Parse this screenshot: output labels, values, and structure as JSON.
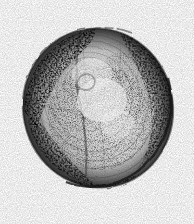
{
  "image": {
    "kind": "scanned-scientific-illustration",
    "medium": "pen-and-ink stipple drawing",
    "subject": "bivalve shell valve",
    "alt_text": "Scanned pen-and-ink stipple illustration of a rounded bivalve shell valve shown in outer face view, with concentric growth lines and graded stippled shading, on a white page with a dark vertical scan edge at the left.",
    "width_px": 194,
    "height_px": 224,
    "background_color": "#ffffff",
    "ink_color": "#2b2b2b",
    "midtone_color": "#8a8a8a",
    "light_tone_color": "#cfcfcf",
    "has_text": false,
    "has_caption": false,
    "has_scale_bar": false
  },
  "artifacts": {
    "scan_edge": {
      "name": "page-edge-line",
      "position": "left",
      "x_px": 3,
      "width_px": 2,
      "color": "#2f2f2f",
      "spans_full_height": true
    }
  },
  "subject": {
    "outline": {
      "shape": "ovate-subcircular",
      "center_x_px": 98,
      "center_y_px": 108,
      "width_px": 150,
      "height_px": 160,
      "rotation_deg": -12,
      "bounds": {
        "left_px": 23,
        "top_px": 28,
        "right_px": 173,
        "bottom_px": 188
      },
      "outline_color": "#262626",
      "outline_weight": "heavy on right and lower margins, lighter on upper left"
    },
    "features": [
      {
        "name": "umbo-beak",
        "location": "upper left of centre",
        "x_px": 78,
        "y_px": 46
      },
      {
        "name": "radial-hinge-line",
        "description": "dark radial band running from the umbo down through the centre-left"
      },
      {
        "name": "concentric-growth-lines",
        "description": "nested arcs following the valve margin, densest on the lower left quadrant"
      },
      {
        "name": "central-highlight",
        "description": "pale unstippled area just below and right of centre",
        "x_px": 100,
        "y_px": 100
      },
      {
        "name": "marginal-shadow",
        "description": "dense stippling along the upper-left and right rims"
      }
    ],
    "shading": {
      "darkest_regions": [
        "upper-left rim",
        "right rim",
        "lower margin"
      ],
      "lightest_regions": [
        "centre",
        "upper-centre"
      ],
      "technique": "stipple and short cross-hatch"
    }
  }
}
